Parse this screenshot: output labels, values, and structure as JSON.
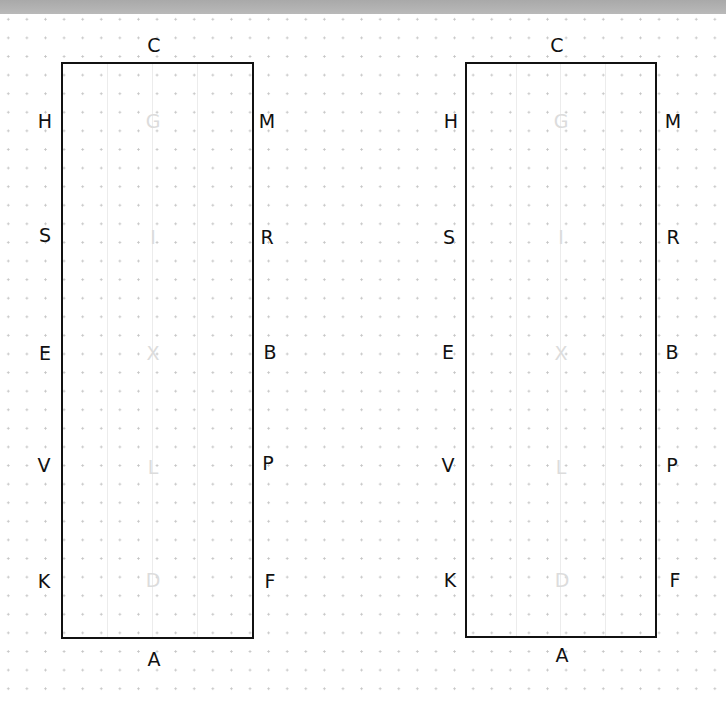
{
  "diagram": {
    "colors": {
      "border": "#111111",
      "inner_letters": "#dcdcdc",
      "grid_dots": "#c4c4c4",
      "top_bar": "#b0b0b0"
    },
    "arenas": [
      {
        "top": "C",
        "bottom": "A",
        "left": [
          "H",
          "S",
          "E",
          "V",
          "K"
        ],
        "right": [
          "M",
          "R",
          "B",
          "P",
          "F"
        ],
        "center": [
          "G",
          "I",
          "X",
          "L",
          "D"
        ]
      },
      {
        "top": "C",
        "bottom": "A",
        "left": [
          "H",
          "S",
          "E",
          "V",
          "K"
        ],
        "right": [
          "M",
          "R",
          "B",
          "P",
          "F"
        ],
        "center": [
          "G",
          "I",
          "X",
          "L",
          "D"
        ]
      }
    ]
  }
}
